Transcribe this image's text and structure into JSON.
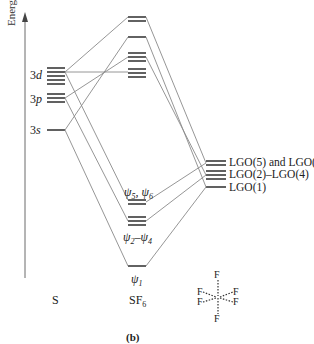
{
  "figure": {
    "axis_label": "Energy",
    "caption": "(b)",
    "columns": {
      "left": "S",
      "middle_main": "SF",
      "middle_sub": "6",
      "right_molecule": {
        "atoms": [
          "F",
          "F",
          "F",
          "F",
          "F",
          "F"
        ],
        "geometry": "octahedral"
      }
    },
    "s_orbitals": [
      {
        "label_num": "3",
        "label_letter": "d",
        "count": 5
      },
      {
        "label_num": "3",
        "label_letter": "p",
        "count": 3
      },
      {
        "label_num": "3",
        "label_letter": "s",
        "count": 1
      }
    ],
    "mo_labels": {
      "psi56": {
        "sym": "ψ",
        "a": "5",
        "sep": ", ",
        "b": "6"
      },
      "psi24": {
        "sym": "ψ",
        "a": "2",
        "sep": "–",
        "b": "4"
      },
      "psi1": {
        "sym": "ψ",
        "a": "1"
      }
    },
    "lgo_labels": [
      "LGO(5) and LGO(6)",
      "LGO(2)–LGO(4)",
      "LGO(1)"
    ]
  }
}
